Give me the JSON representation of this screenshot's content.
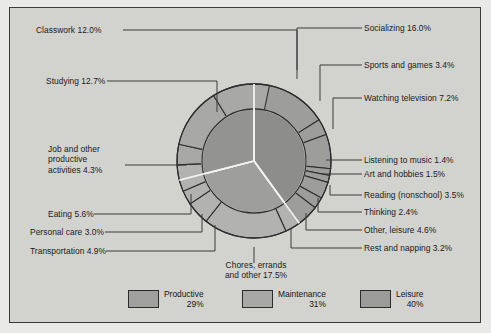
{
  "chart_data": {
    "type": "pie",
    "title": "",
    "subtitle": "",
    "xlabel": "",
    "ylabel": "",
    "legend_position": "bottom",
    "grid": false,
    "units": "percent of time",
    "inner_ring": {
      "name": "Broad category",
      "labels": [
        "Productive",
        "Maintenance",
        "Leisure"
      ],
      "values": [
        29,
        31,
        40
      ],
      "colors": [
        "#9a9a98",
        "#a3a3a1",
        "#8e8e8c"
      ]
    },
    "outer_ring": {
      "name": "Activity",
      "labels": [
        "Socializing",
        "Sports and games",
        "Watching television",
        "Listening to music",
        "Art and hobbies",
        "Reading (nonschool)",
        "Thinking",
        "Other, leisure",
        "Rest and napping",
        "Chores, errands and other",
        "Transportation",
        "Personal care",
        "Eating",
        "Job and other productive activities",
        "Studying",
        "Classwork"
      ],
      "values": [
        16.0,
        3.4,
        7.2,
        1.4,
        1.5,
        3.5,
        2.4,
        4.6,
        3.2,
        17.5,
        4.9,
        3.0,
        5.6,
        4.3,
        12.7,
        12.0
      ],
      "group": [
        "Leisure",
        "Leisure",
        "Leisure",
        "Leisure",
        "Leisure",
        "Leisure",
        "Leisure",
        "Leisure",
        "Maintenance",
        "Maintenance",
        "Maintenance",
        "Maintenance",
        "Maintenance",
        "Productive",
        "Productive",
        "Productive"
      ]
    }
  },
  "labels": {
    "classwork": "Classwork 12.0%",
    "studying": "Studying 12.7%",
    "job": "Job and other productive activities 4.3%",
    "job_l1": "Job and other",
    "job_l2": "productive",
    "job_l3": "activities 4.3%",
    "eating": "Eating 5.6%",
    "personal_care": "Personal care 3.0%",
    "transportation": "Transportation 4.9%",
    "chores_l1": "Chores, errands",
    "chores_l2": "and other 17.5%",
    "socializing": "Socializing 16.0%",
    "sports": "Sports and games 3.4%",
    "television": "Watching television 7.2%",
    "music": "Listening to music 1.4%",
    "art": "Art and hobbies 1.5%",
    "reading": "Reading (nonschool) 3.5%",
    "thinking": "Thinking 2.4%",
    "other_leisure": "Other, leisure 4.6%",
    "rest": "Rest and napping 3.2%"
  },
  "legend": {
    "items": [
      {
        "label": "Productive",
        "pct": "29%",
        "color": "#a0a09e"
      },
      {
        "label": "Maintenance",
        "pct": "31%",
        "color": "#a8a8a6"
      },
      {
        "label": "Leisure",
        "pct": "40%",
        "color": "#9b9b99"
      }
    ]
  },
  "colors": {
    "panel_bg": "#d2d2cf",
    "page_bg": "#e9e9e7",
    "panel_border": "#3b3b3b",
    "text": "#1a1a1a",
    "leader_line": "#3a3a3a",
    "inner_divider": "#f2f2f0",
    "outer_divider": "#2e2e2e"
  }
}
